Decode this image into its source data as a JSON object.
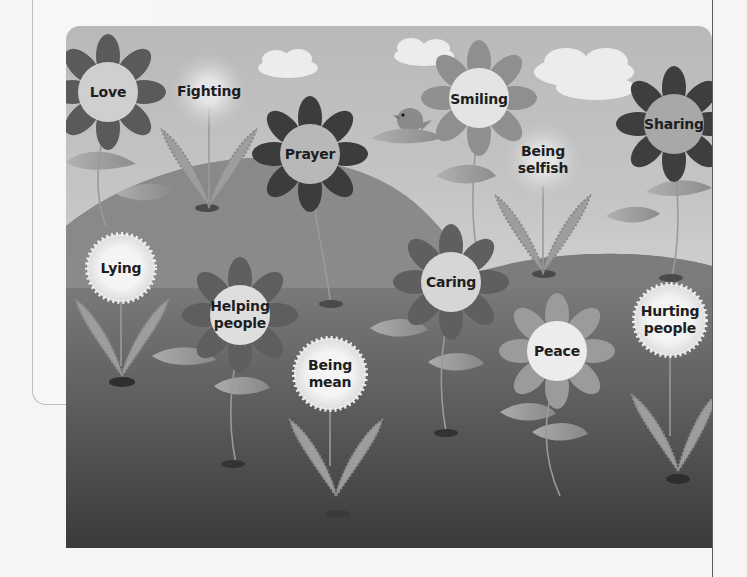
{
  "illustration": {
    "title": "",
    "flowers": [
      {
        "id": "love",
        "label": "Love",
        "kind": "flower",
        "cx": 42,
        "cy": 66,
        "petal": "#5a5a5a",
        "center": "#cfcfcf"
      },
      {
        "id": "fighting",
        "label": "Fighting",
        "kind": "weed",
        "cx": 143,
        "cy": 65,
        "center": "#e8e8e8"
      },
      {
        "id": "prayer",
        "label": "Prayer",
        "kind": "flower",
        "cx": 244,
        "cy": 128,
        "petal": "#3c3c3c",
        "center": "#b8b8b8"
      },
      {
        "id": "smiling",
        "label": "Smiling",
        "kind": "flower",
        "cx": 413,
        "cy": 72,
        "petal": "#8f8f8f",
        "center": "#e4e4e4"
      },
      {
        "id": "being-selfish",
        "label": [
          "Being",
          "selfish"
        ],
        "kind": "weed",
        "cx": 477,
        "cy": 134,
        "center": "#cfcfcf"
      },
      {
        "id": "sharing",
        "label": "Sharing",
        "kind": "flower",
        "cx": 608,
        "cy": 98,
        "petal": "#3e3e3e",
        "center": "#a8a8a8"
      },
      {
        "id": "lying",
        "label": "Lying",
        "kind": "weed",
        "cx": 55,
        "cy": 242,
        "center": "#f0f0f0"
      },
      {
        "id": "helping-people",
        "label": [
          "Helping",
          "people"
        ],
        "kind": "flower",
        "cx": 174,
        "cy": 289,
        "petal": "#5e5e5e",
        "center": "#dedede"
      },
      {
        "id": "caring",
        "label": "Caring",
        "kind": "flower",
        "cx": 385,
        "cy": 256,
        "petal": "#5f5f5f",
        "center": "#d6d6d6"
      },
      {
        "id": "being-mean",
        "label": [
          "Being",
          "mean"
        ],
        "kind": "weed",
        "cx": 264,
        "cy": 348,
        "center": "#f2f2f2"
      },
      {
        "id": "peace",
        "label": "Peace",
        "kind": "flower",
        "cx": 491,
        "cy": 325,
        "petal": "#9b9b9b",
        "center": "#ececec"
      },
      {
        "id": "hurting-people",
        "label": [
          "Hurting",
          "people"
        ],
        "kind": "weed",
        "cx": 604,
        "cy": 294,
        "center": "#f0f0f0"
      }
    ],
    "clouds": [
      {
        "cx": 225,
        "cy": 38
      },
      {
        "cx": 358,
        "cy": 30
      },
      {
        "cx": 522,
        "cy": 50
      }
    ],
    "colors": {
      "sky": "#c4c4c4",
      "hill_left": "#8d8d8d",
      "hill_right": "#7a7a7a",
      "ground_top": "#707070",
      "ground_bottom": "#3e3e3e",
      "leaf": "#a4a4a4",
      "bird": "#8a8a8a"
    }
  }
}
